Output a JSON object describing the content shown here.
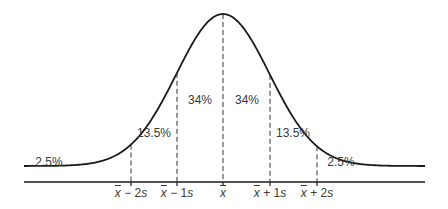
{
  "diagram": {
    "title": "",
    "type": "normal-distribution",
    "regions": [
      {
        "label": "2.5%",
        "x": 49,
        "y": 163
      },
      {
        "label": "13.5%",
        "x": 154,
        "y": 134
      },
      {
        "label": "34%",
        "x": 200,
        "y": 101
      },
      {
        "label": "34%",
        "x": 247,
        "y": 101
      },
      {
        "label": "13.5%",
        "x": 293,
        "y": 134
      },
      {
        "label": "2.5%",
        "x": 341,
        "y": 163
      }
    ],
    "ticks": [
      {
        "mean": "x",
        "op": " − ",
        "k": "2",
        "unit": "s",
        "x": 131
      },
      {
        "mean": "x",
        "op": " − ",
        "k": "1",
        "unit": "s",
        "x": 177
      },
      {
        "mean": "x",
        "op": "",
        "k": "",
        "unit": "",
        "x": 223
      },
      {
        "mean": "x",
        "op": " + ",
        "k": "1",
        "unit": "s",
        "x": 270
      },
      {
        "mean": "x",
        "op": " + ",
        "k": "2",
        "unit": "s",
        "x": 317
      }
    ],
    "colors": {
      "curve": "#1a1a1a",
      "axis": "#1a1a1a",
      "dash": "#333333",
      "text": "#3a3a3a"
    }
  }
}
